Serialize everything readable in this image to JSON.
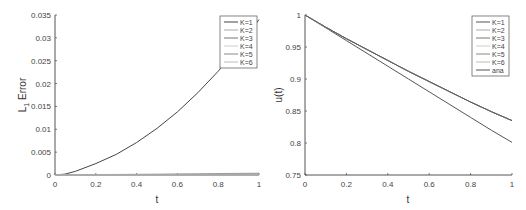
{
  "chart_data": [
    {
      "type": "line",
      "title": "",
      "xlabel": "t",
      "ylabel": "L1 Error",
      "ylabel_main": "L",
      "ylabel_sub": "1",
      "ylabel_rest": " Error",
      "xlim": [
        0,
        1
      ],
      "ylim": [
        0,
        0.035
      ],
      "xticks": [
        "0",
        "0.2",
        "0.4",
        "0.6",
        "0.8",
        "1"
      ],
      "yticks": [
        "0",
        "0.005",
        "0.01",
        "0.015",
        "0.02",
        "0.025",
        "0.03",
        "0.035"
      ],
      "grid": false,
      "legend_position": "upper right",
      "x": [
        0,
        0.05,
        0.1,
        0.2,
        0.3,
        0.4,
        0.5,
        0.6,
        0.7,
        0.8,
        0.9,
        1.0
      ],
      "series": [
        {
          "name": "K=1",
          "color": "#444444",
          "values": [
            0,
            0.0002,
            0.0008,
            0.0025,
            0.0045,
            0.0071,
            0.0102,
            0.0138,
            0.018,
            0.0227,
            0.028,
            0.034
          ]
        },
        {
          "name": "K=2",
          "color": "#aaaaaa",
          "values": [
            0,
            2e-05,
            4e-05,
            8e-05,
            0.00012,
            0.00016,
            0.0002,
            0.00024,
            0.00028,
            0.00032,
            0.00036,
            0.0004
          ]
        },
        {
          "name": "K=3",
          "color": "#777777",
          "values": [
            0,
            1e-05,
            2e-05,
            4e-05,
            6e-05,
            8e-05,
            0.0001,
            0.00012,
            0.00014,
            0.00016,
            0.00018,
            0.0002
          ]
        },
        {
          "name": "K=4",
          "color": "#cccccc",
          "values": [
            0,
            0,
            0,
            0,
            0,
            0,
            0,
            0,
            0,
            0,
            0,
            0
          ]
        },
        {
          "name": "K=5",
          "color": "#888888",
          "values": [
            0,
            0,
            0,
            0,
            0,
            0,
            0,
            0,
            0,
            0,
            0,
            0
          ]
        },
        {
          "name": "K=6",
          "color": "#bbbbbb",
          "values": [
            0,
            0,
            0,
            0,
            0,
            0,
            0,
            0,
            0,
            0,
            0,
            0
          ]
        }
      ]
    },
    {
      "type": "line",
      "title": "",
      "xlabel": "t",
      "ylabel": "u(t)",
      "xlim": [
        0,
        1
      ],
      "ylim": [
        0.75,
        1
      ],
      "xticks": [
        "0",
        "0.2",
        "0.4",
        "0.6",
        "0.8",
        "1"
      ],
      "yticks": [
        "0.75",
        "0.8",
        "0.85",
        "0.9",
        "0.95",
        "1"
      ],
      "grid": false,
      "legend_position": "upper right",
      "x": [
        0,
        0.1,
        0.2,
        0.3,
        0.4,
        0.5,
        0.6,
        0.7,
        0.8,
        0.9,
        1.0
      ],
      "series": [
        {
          "name": "K=1",
          "color": "#555555",
          "values": [
            1.0,
            0.98,
            0.96,
            0.94,
            0.92,
            0.9,
            0.88,
            0.86,
            0.84,
            0.82,
            0.801
          ]
        },
        {
          "name": "K=2",
          "color": "#aaaaaa",
          "values": [
            1.0,
            0.981,
            0.963,
            0.946,
            0.929,
            0.912,
            0.896,
            0.88,
            0.864,
            0.849,
            0.835
          ]
        },
        {
          "name": "K=3",
          "color": "#777777",
          "values": [
            1.0,
            0.981,
            0.963,
            0.946,
            0.929,
            0.912,
            0.896,
            0.88,
            0.864,
            0.849,
            0.835
          ]
        },
        {
          "name": "K=4",
          "color": "#cccccc",
          "values": [
            1.0,
            0.981,
            0.963,
            0.946,
            0.929,
            0.912,
            0.896,
            0.88,
            0.864,
            0.849,
            0.835
          ]
        },
        {
          "name": "K=5",
          "color": "#888888",
          "values": [
            1.0,
            0.981,
            0.963,
            0.946,
            0.929,
            0.912,
            0.896,
            0.88,
            0.864,
            0.849,
            0.835
          ]
        },
        {
          "name": "K=6",
          "color": "#bbbbbb",
          "values": [
            1.0,
            0.981,
            0.963,
            0.946,
            0.929,
            0.912,
            0.896,
            0.88,
            0.864,
            0.849,
            0.835
          ]
        },
        {
          "name": "ana",
          "color": "#555555",
          "values": [
            1.0,
            0.981,
            0.963,
            0.946,
            0.929,
            0.912,
            0.896,
            0.88,
            0.864,
            0.849,
            0.835
          ]
        }
      ]
    }
  ]
}
